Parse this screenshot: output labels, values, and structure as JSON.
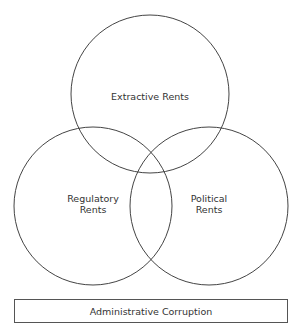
{
  "diagram": {
    "type": "venn",
    "stroke_color": "#444444",
    "circles": [
      {
        "id": "extractive",
        "lines": [
          "Extractive Rents"
        ],
        "cx": 150,
        "cy": 94,
        "r": 79
      },
      {
        "id": "regulatory",
        "lines": [
          "Regulatory",
          "Rents"
        ],
        "cx": 93,
        "cy": 206,
        "r": 79
      },
      {
        "id": "political",
        "lines": [
          "Political",
          "Rents"
        ],
        "cx": 209,
        "cy": 206,
        "r": 79
      }
    ],
    "footer_box": {
      "label": "Administrative Corruption"
    }
  }
}
